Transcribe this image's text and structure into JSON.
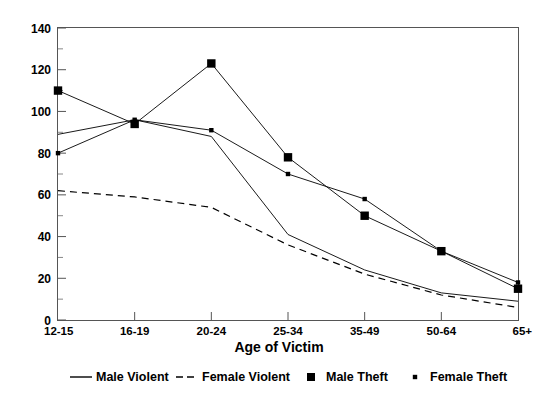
{
  "chart_data": {
    "type": "line",
    "title": "",
    "xlabel": "Age of Victim",
    "ylabel": "",
    "categories": [
      "12-15",
      "16-19",
      "20-24",
      "25-34",
      "35-49",
      "50-64",
      "65+"
    ],
    "ylim": [
      0,
      140
    ],
    "ytick_labels": [
      "0",
      "20",
      "40",
      "60",
      "80",
      "100",
      "120",
      "140"
    ],
    "ytick_values": [
      0,
      20,
      40,
      60,
      80,
      100,
      120,
      140
    ],
    "minor_ytick_values": [
      10,
      30,
      50,
      70,
      90,
      110,
      130
    ],
    "grid": false,
    "legend_position": "bottom",
    "series": [
      {
        "name": "Male Violent",
        "style": "solid-line",
        "marker": "none",
        "color": "#000000",
        "values": [
          89,
          96,
          88,
          41,
          24,
          13,
          9
        ]
      },
      {
        "name": "Female Violent",
        "style": "dashed-line",
        "marker": "none",
        "color": "#000000",
        "values": [
          62,
          59,
          54,
          36,
          22,
          12,
          6
        ]
      },
      {
        "name": "Male Theft",
        "style": "solid-line",
        "marker": "square-large",
        "color": "#000000",
        "values": [
          110,
          94,
          123,
          78,
          50,
          33,
          15
        ]
      },
      {
        "name": "Female Theft",
        "style": "solid-line",
        "marker": "square-small",
        "color": "#000000",
        "values": [
          80,
          96,
          91,
          70,
          58,
          33,
          18
        ]
      }
    ]
  },
  "legend": {
    "items": [
      {
        "label": "Male Violent",
        "swatch": "solid-line-swatch"
      },
      {
        "label": "Female Violent",
        "swatch": "dashed-line-swatch"
      },
      {
        "label": "Male Theft",
        "swatch": "large-square-swatch"
      },
      {
        "label": "Female Theft",
        "swatch": "small-square-swatch"
      }
    ]
  },
  "axis": {
    "x_title": "Age of Victim"
  }
}
